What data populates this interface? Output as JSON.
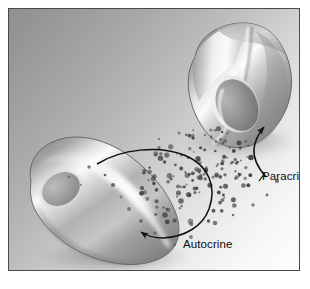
{
  "figure": {
    "panel": {
      "background_top_left_color": "#8f8f8f",
      "background_bottom_right_color": "#fdfdfd",
      "border_color": "#4a4a4a",
      "outer_background_color": "#ffffff"
    }
  },
  "labels": {
    "paracrine": "Paracrine",
    "autocrine": "Autocrine",
    "text_color": "#0d0d0d"
  },
  "cells": [
    {
      "id": "target-cell",
      "name": "Upper angular target cell",
      "shape": "polygonal",
      "fill_color": "#b9b9b9",
      "highlight_color": "#fbfbfb",
      "outline_color": "#5d5d5d",
      "nucleus": {
        "name": "target-cell-nucleus",
        "shape": "ellipse",
        "fill_color": "#8c8c8c"
      }
    },
    {
      "id": "signaling-cell",
      "name": "Lower elongated signaling cell",
      "shape": "bean",
      "fill_color": "#b5b5b5",
      "highlight_color": "#fcfcfc",
      "outline_color": "#606060",
      "nucleus": {
        "name": "signaling-cell-nucleus",
        "shape": "ellipse",
        "fill_color": "#8f8f8f"
      }
    }
  ],
  "signal_molecules": {
    "name": "secreted signal molecule cloud",
    "color": "#474747",
    "count": 150,
    "description": "Cloud of small dark dots released from the signaling cell"
  },
  "arrows": [
    {
      "id": "paracrine-arrow",
      "label": "Paracrine",
      "description": "Curved arrow from the molecule cloud to the upper target cell",
      "color": "#111111"
    },
    {
      "id": "autocrine-arrow",
      "label": "Autocrine",
      "description": "Looping arrow from the signaling cell surface back onto the same cell",
      "color": "#111111"
    }
  ],
  "chart_data": {
    "type": "diagram",
    "nodes": [
      {
        "id": "signaling-cell",
        "label": "",
        "role": "secreting cell",
        "x": 95,
        "y": 205
      },
      {
        "id": "target-cell",
        "label": "",
        "role": "neighbouring target cell",
        "x": 230,
        "y": 85
      },
      {
        "id": "molecule-cloud",
        "label": "",
        "role": "signal molecules",
        "x": 190,
        "y": 170
      }
    ],
    "edges": [
      {
        "from": "molecule-cloud",
        "to": "target-cell",
        "label": "Paracrine",
        "style": "curved-arrow"
      },
      {
        "from": "signaling-cell",
        "to": "signaling-cell",
        "label": "Autocrine",
        "style": "loop-arrow"
      }
    ]
  }
}
